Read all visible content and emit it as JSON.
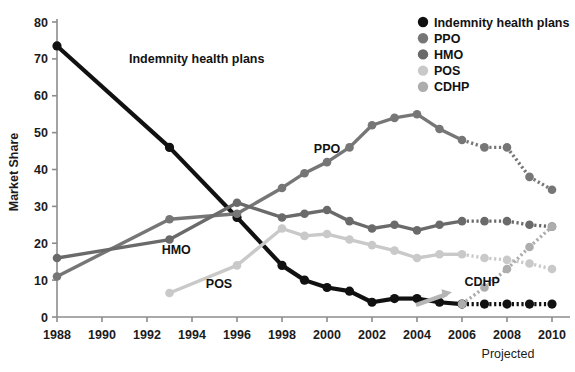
{
  "chart_data": {
    "type": "line",
    "title": "",
    "xlabel": "",
    "ylabel": "Market Share",
    "xlim": [
      1988,
      2010
    ],
    "ylim": [
      0,
      80
    ],
    "xticks": [
      1988,
      1990,
      1992,
      1994,
      1996,
      1998,
      2000,
      2002,
      2004,
      2006,
      2008,
      2010
    ],
    "yticks": [
      0,
      10,
      20,
      30,
      40,
      50,
      60,
      70,
      80
    ],
    "grid": false,
    "legend_position": "top-right",
    "projection_note": "Projected",
    "projection_start_year": 2006,
    "series": [
      {
        "name": "Indemnity health plans",
        "color": "#111111",
        "x": [
          1988,
          1993,
          1996,
          1998,
          1999,
          2000,
          2001,
          2002,
          2003,
          2004,
          2005,
          2006,
          2007,
          2008,
          2009,
          2010
        ],
        "values": [
          73.5,
          46,
          27,
          14,
          10,
          8,
          7,
          4,
          5,
          5,
          4,
          3.5,
          3.5,
          3.5,
          3.5,
          3.5
        ]
      },
      {
        "name": "PPO",
        "color": "#767676",
        "x": [
          1988,
          1993,
          1996,
          1998,
          1999,
          2000,
          2001,
          2002,
          2003,
          2004,
          2005,
          2006,
          2007,
          2008,
          2009,
          2010
        ],
        "values": [
          11,
          26.5,
          28,
          35,
          39,
          42,
          46,
          52,
          54,
          55,
          51,
          48,
          46,
          46,
          38,
          34.5
        ]
      },
      {
        "name": "HMO",
        "color": "#6a6a6a",
        "x": [
          1988,
          1993,
          1996,
          1998,
          1999,
          2000,
          2001,
          2002,
          2003,
          2004,
          2005,
          2006,
          2007,
          2008,
          2009,
          2010
        ],
        "values": [
          16,
          21,
          31,
          27,
          28,
          29,
          26,
          24,
          25,
          23.5,
          25,
          26,
          26,
          26,
          25,
          24.5
        ]
      },
      {
        "name": "POS",
        "color": "#c9c9c9",
        "x": [
          1993,
          1996,
          1998,
          1999,
          2000,
          2001,
          2002,
          2003,
          2004,
          2005,
          2006,
          2007,
          2008,
          2009,
          2010
        ],
        "values": [
          6.5,
          14,
          24,
          22,
          22.5,
          21,
          19.5,
          18,
          16,
          17,
          17,
          16,
          15.5,
          14.5,
          13
        ]
      },
      {
        "name": "CDHP",
        "color": "#adadad",
        "x": [
          2006,
          2007,
          2008,
          2009,
          2010
        ],
        "values": [
          3.5,
          8,
          13,
          19,
          24.5
        ]
      }
    ],
    "annotations": [
      {
        "text": "Indemnity health plans",
        "x": 1991.2,
        "y": 69,
        "anchor": "start"
      },
      {
        "text": "PPO",
        "x": 2000.0,
        "y": 44.5,
        "anchor": "middle"
      },
      {
        "text": "HMO",
        "x": 1993.3,
        "y": 17.0,
        "anchor": "middle"
      },
      {
        "text": "POS",
        "x": 1995.2,
        "y": 8.0,
        "anchor": "middle"
      },
      {
        "text": "CDHP",
        "x": 2006.9,
        "y": 8.3,
        "anchor": "middle"
      }
    ],
    "legend": [
      {
        "label": "Indemnity health plans",
        "color": "#111111"
      },
      {
        "label": "PPO",
        "color": "#767676"
      },
      {
        "label": "HMO",
        "color": "#6a6a6a"
      },
      {
        "label": "POS",
        "color": "#c9c9c9"
      },
      {
        "label": "CDHP",
        "color": "#adadad"
      }
    ]
  }
}
